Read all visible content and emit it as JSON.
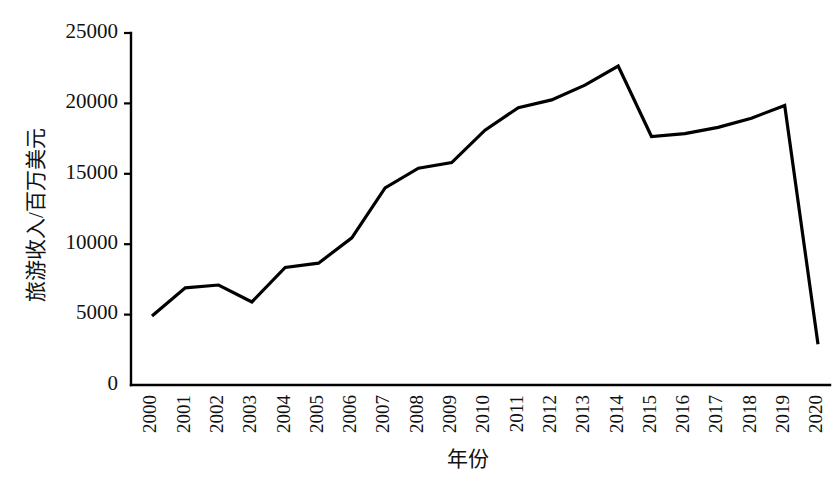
{
  "chart_data": {
    "type": "line",
    "title": "",
    "xlabel": "年份",
    "ylabel": "旅游收入/百万美元",
    "categories": [
      "2000",
      "2001",
      "2002",
      "2003",
      "2004",
      "2005",
      "2006",
      "2007",
      "2008",
      "2009",
      "2010",
      "2011",
      "2012",
      "2013",
      "2014",
      "2015",
      "2016",
      "2017",
      "2018",
      "2019",
      "2020"
    ],
    "values": [
      4900,
      6900,
      7100,
      5900,
      8350,
      8650,
      10450,
      14000,
      15400,
      15800,
      18100,
      19700,
      20250,
      21300,
      22650,
      17650,
      17850,
      18300,
      18950,
      19850,
      2900
    ],
    "series": [
      {
        "name": "旅游收入",
        "values": [
          4900,
          6900,
          7100,
          5900,
          8350,
          8650,
          10450,
          14000,
          15400,
          15800,
          18100,
          19700,
          20250,
          21300,
          22650,
          17650,
          17850,
          18300,
          18950,
          19850,
          2900
        ]
      }
    ],
    "ytick_labels": [
      "0",
      "5000",
      "10000",
      "15000",
      "20000",
      "25000"
    ],
    "ytick_values": [
      0,
      5000,
      10000,
      15000,
      20000,
      25000
    ],
    "ylim": [
      0,
      25000
    ],
    "xlim": [
      "2000",
      "2020"
    ],
    "grid": false,
    "legend": "none",
    "line_color": "#000000"
  }
}
